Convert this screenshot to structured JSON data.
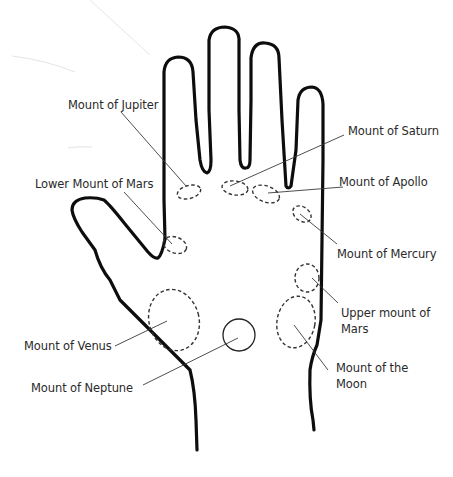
{
  "diagram": {
    "title": "",
    "colors": {
      "outline": "#0d0d0d",
      "leader": "#3a3a3a",
      "text": "#2a2a2a",
      "background": "#ffffff"
    },
    "labels": [
      {
        "id": "jupiter",
        "text": "Mount of Jupiter"
      },
      {
        "id": "saturn",
        "text": "Mount of Saturn"
      },
      {
        "id": "apollo",
        "text": "Mount of Apollo"
      },
      {
        "id": "lower_mars",
        "text": "Lower Mount of Mars"
      },
      {
        "id": "mercury",
        "text": "Mount of Mercury"
      },
      {
        "id": "upper_mars_1",
        "text": "Upper mount of"
      },
      {
        "id": "upper_mars_2",
        "text": "Mars"
      },
      {
        "id": "venus",
        "text": "Mount of Venus"
      },
      {
        "id": "neptune",
        "text": "Mount of Neptune"
      },
      {
        "id": "moon_1",
        "text": "Mount of the"
      },
      {
        "id": "moon_2",
        "text": "Moon"
      }
    ]
  }
}
